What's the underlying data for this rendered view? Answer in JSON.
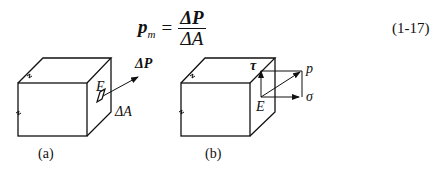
{
  "equation": {
    "lhs_symbol": "p",
    "lhs_subscript": "m",
    "equals": "=",
    "numerator": "ΔP",
    "denominator": "ΔA",
    "number": "(1-17)"
  },
  "figure_a": {
    "caption": "(a)",
    "point_label": "E",
    "force_label": "ΔP",
    "area_label": "ΔA"
  },
  "figure_b": {
    "caption": "(b)",
    "point_label": "E",
    "tau_label": "τ",
    "p_label": "p",
    "sigma_label": "σ"
  }
}
